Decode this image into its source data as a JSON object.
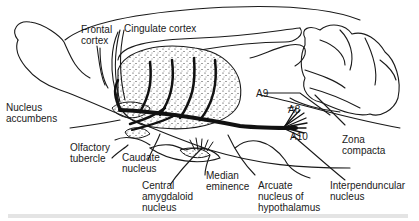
{
  "figure": {
    "type": "sagittal brain section diagram of dopaminergic pathways",
    "labels": {
      "frontal_cortex": "Frontal\ncortex",
      "cingulate_cortex": "Cingulate cortex",
      "nucleus_accumbens": "Nucleus\naccumbens",
      "olfactory_tubercle": "Olfactory\ntubercle",
      "caudate_nucleus": "Caudate\nnucleus",
      "central_amygdaloid_nucleus": "Central\namygdaloid\nnucleus",
      "median_eminence": "Median\neminence",
      "arcuate_nucleus": "Arcuate\nnucleus of\nhypothalamus",
      "interpeduncular_nucleus": "Interpenduncular\nnucleus",
      "zona_compacta": "Zona\ncompacta",
      "a9": "A9",
      "a8": "A8",
      "a10": "A10"
    },
    "colors": {
      "ink": "#1a1a1a",
      "background": "#ffffff"
    }
  }
}
